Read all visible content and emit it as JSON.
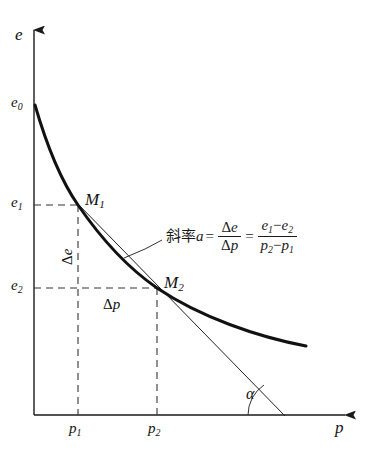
{
  "figure": {
    "type": "diagram",
    "axes": {
      "y_label": "e",
      "x_label": "p",
      "origin": [
        34,
        415
      ],
      "x_axis_end": [
        356,
        415
      ],
      "y_axis_top": [
        34,
        22
      ]
    },
    "y_ticks": [
      {
        "id": "e0",
        "base": "e",
        "sub": "0",
        "y": 105
      },
      {
        "id": "e1",
        "base": "e",
        "sub": "1",
        "y": 205
      },
      {
        "id": "e2",
        "base": "e",
        "sub": "2",
        "y": 288
      }
    ],
    "x_ticks": [
      {
        "id": "p1",
        "base": "p",
        "sub": "1",
        "x": 78
      },
      {
        "id": "p2",
        "base": "p",
        "sub": "2",
        "x": 157
      }
    ],
    "points": [
      {
        "id": "M1",
        "base": "M",
        "sub": "1",
        "x": 78,
        "y": 205
      },
      {
        "id": "M2",
        "base": "M",
        "sub": "2",
        "x": 157,
        "y": 288
      }
    ],
    "deltas": {
      "delta_e": {
        "symbol": "Δ",
        "var": "e"
      },
      "delta_p": {
        "symbol": "Δ",
        "var": "p"
      }
    },
    "angle": {
      "label": "α"
    },
    "formula": {
      "prefix_cn": "斜率",
      "variable": "a",
      "equals": "=",
      "frac1": {
        "num_sym": "Δ",
        "num_var": "e",
        "den_sym": "Δ",
        "den_var": "p"
      },
      "frac2": {
        "num_a": "e",
        "num_a_sub": "1",
        "num_op": "−",
        "num_b": "e",
        "num_b_sub": "2",
        "den_a": "p",
        "den_a_sub": "2",
        "den_op": "−",
        "den_b": "p",
        "den_b_sub": "1"
      }
    },
    "colors": {
      "ink": "#1a1a1a",
      "curve": "#111111",
      "dashed": "#333333",
      "tangent": "#222222"
    }
  }
}
